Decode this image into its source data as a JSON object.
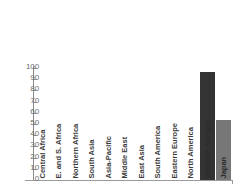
{
  "chart_data": {
    "type": "bar",
    "title": "",
    "subtitle": "",
    "xlabel": "",
    "ylabel": "",
    "ylim": [
      0,
      100
    ],
    "yticks": [
      0,
      10,
      20,
      30,
      40,
      50,
      60,
      70,
      80,
      90,
      100
    ],
    "grid": false,
    "legend": "none",
    "categories": [
      "Central Africa",
      "E. and S. Africa",
      "Northern Africa",
      "South Asia",
      "Asia-Pacific",
      "Middle East",
      "East Asia",
      "South America",
      "Eastern Europe",
      "North America",
      "Western Europe",
      "Japan"
    ],
    "values": [
      0,
      0,
      0,
      0,
      0,
      0,
      0,
      0,
      0,
      0,
      96,
      54
    ],
    "bar_colors": [
      "#333333",
      "#333333",
      "#333333",
      "#333333",
      "#333333",
      "#333333",
      "#333333",
      "#333333",
      "#333333",
      "#333333",
      "#333333",
      "#777777"
    ]
  },
  "axis": {
    "line_color": "#8a8a8a",
    "tick_label_color": "#6d6d6d"
  },
  "background_color": "#ffffff"
}
